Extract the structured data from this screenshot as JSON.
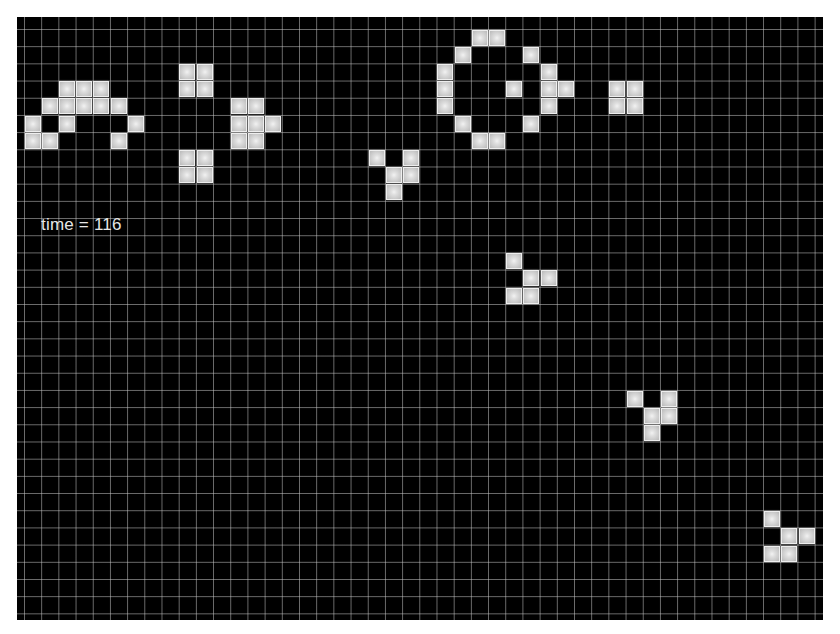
{
  "simulation": {
    "title": "Conway's Game of Life",
    "time_label": "time = 116",
    "time": 116
  },
  "grid": {
    "cell_size_px": 17.2,
    "origin_px": [
      6.8,
      11.8
    ],
    "colors": {
      "background": "#000000",
      "grid_line": "#c8c8c8",
      "live_cell": "#c9c9c9",
      "text": "#e6e6e6"
    }
  },
  "live_cells": [
    {
      "pattern": "left-arc",
      "cells": [
        [
          3,
          4
        ],
        [
          4,
          4
        ],
        [
          5,
          4
        ],
        [
          2,
          5
        ],
        [
          3,
          5
        ],
        [
          4,
          5
        ],
        [
          5,
          5
        ],
        [
          6,
          5
        ],
        [
          1,
          6
        ],
        [
          3,
          6
        ],
        [
          7,
          6
        ],
        [
          1,
          7
        ],
        [
          2,
          7
        ],
        [
          6,
          7
        ]
      ]
    },
    {
      "pattern": "block-top",
      "cells": [
        [
          10,
          3
        ],
        [
          11,
          3
        ],
        [
          10,
          4
        ],
        [
          11,
          4
        ]
      ]
    },
    {
      "pattern": "block-bottom",
      "cells": [
        [
          10,
          8
        ],
        [
          11,
          8
        ],
        [
          10,
          9
        ],
        [
          11,
          9
        ]
      ]
    },
    {
      "pattern": "middle-cluster",
      "cells": [
        [
          13,
          5
        ],
        [
          14,
          5
        ],
        [
          13,
          6
        ],
        [
          14,
          6
        ],
        [
          15,
          6
        ],
        [
          13,
          7
        ],
        [
          14,
          7
        ]
      ]
    },
    {
      "pattern": "glider-1",
      "cells": [
        [
          21,
          8
        ],
        [
          23,
          8
        ],
        [
          22,
          9
        ],
        [
          23,
          9
        ],
        [
          22,
          10
        ]
      ]
    },
    {
      "pattern": "ring",
      "cells": [
        [
          27,
          1
        ],
        [
          28,
          1
        ],
        [
          26,
          2
        ],
        [
          30,
          2
        ],
        [
          25,
          3
        ],
        [
          31,
          3
        ],
        [
          25,
          4
        ],
        [
          29,
          4
        ],
        [
          31,
          4
        ],
        [
          32,
          4
        ],
        [
          25,
          5
        ],
        [
          31,
          5
        ],
        [
          26,
          6
        ],
        [
          30,
          6
        ],
        [
          27,
          7
        ],
        [
          28,
          7
        ]
      ]
    },
    {
      "pattern": "block-right",
      "cells": [
        [
          35,
          4
        ],
        [
          36,
          4
        ],
        [
          35,
          5
        ],
        [
          36,
          5
        ]
      ]
    },
    {
      "pattern": "glider-2",
      "cells": [
        [
          29,
          14
        ],
        [
          30,
          15
        ],
        [
          31,
          15
        ],
        [
          29,
          16
        ],
        [
          30,
          16
        ]
      ]
    },
    {
      "pattern": "glider-3",
      "cells": [
        [
          36,
          22
        ],
        [
          38,
          22
        ],
        [
          37,
          23
        ],
        [
          38,
          23
        ],
        [
          37,
          24
        ]
      ]
    },
    {
      "pattern": "glider-4",
      "cells": [
        [
          44,
          29
        ],
        [
          45,
          30
        ],
        [
          46,
          30
        ],
        [
          44,
          31
        ],
        [
          45,
          31
        ]
      ]
    }
  ]
}
